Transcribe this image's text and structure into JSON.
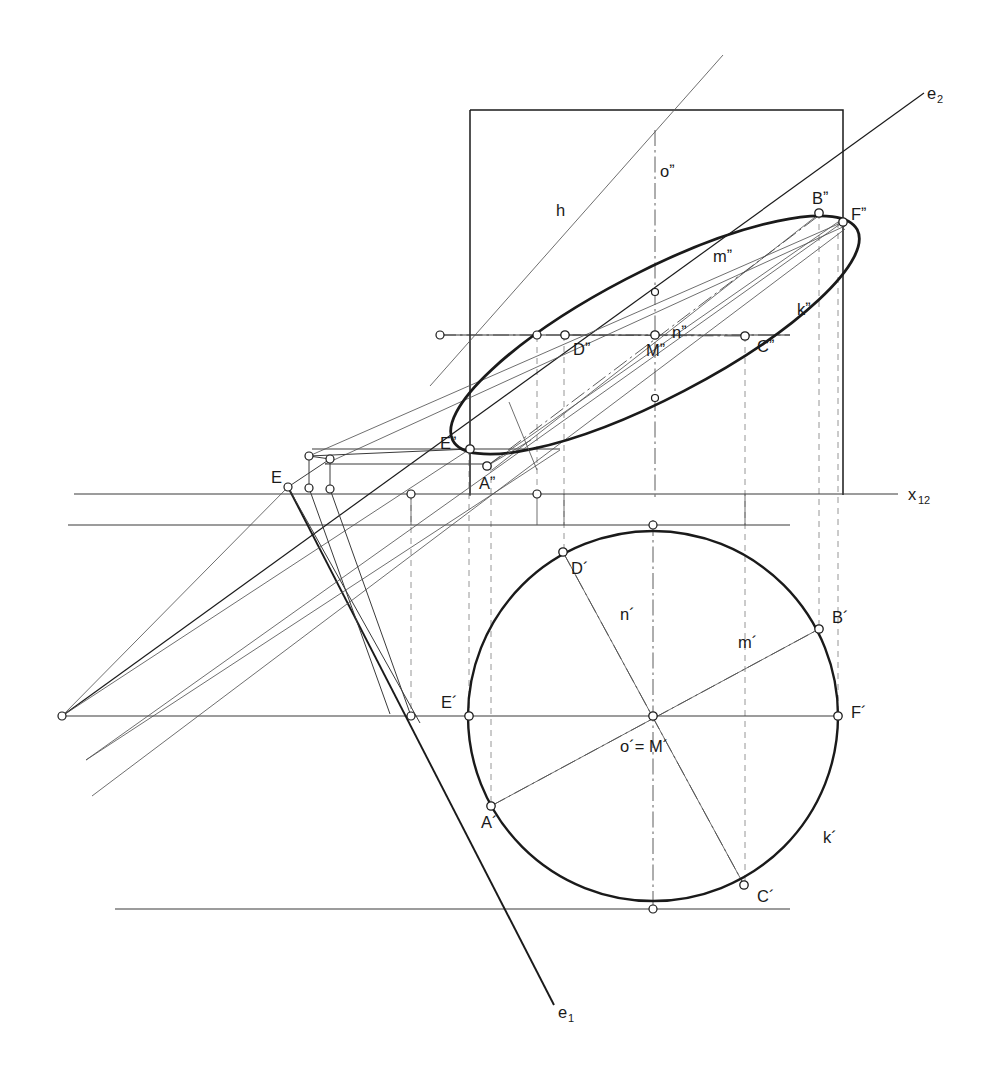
{
  "figure": {
    "kind": "descriptive-geometry-construction",
    "background_color": "#ffffff",
    "ink_color": "#1a1a1a",
    "thin_color": "#555555",
    "ground_line_label": "x_12"
  },
  "labels": {
    "axis_x12": {
      "text": "x",
      "sub": "12",
      "x": 912,
      "y": 497
    },
    "axis_e2": {
      "text": "e",
      "sub": "2",
      "x": 929,
      "y": 98
    },
    "axis_e1": {
      "text": "e",
      "sub": "1",
      "x": 561,
      "y": 1017
    },
    "h_line": {
      "text": "h",
      "x": 556,
      "y": 216
    },
    "o_front": {
      "text": "oˮ",
      "x": 660,
      "y": 177
    },
    "m_front": {
      "text": "mˮ",
      "x": 718,
      "y": 262
    },
    "n_front": {
      "text": "nˮ",
      "x": 672,
      "y": 338
    },
    "k_front": {
      "text": "kˮ",
      "x": 797,
      "y": 315
    },
    "n_top": {
      "text": "n´",
      "x": 622,
      "y": 620
    },
    "m_top": {
      "text": "m´",
      "x": 742,
      "y": 648
    },
    "k_top": {
      "text": "k´",
      "x": 823,
      "y": 843
    },
    "center_top": {
      "text": "o´= M´",
      "x": 622,
      "y": 752
    },
    "E_true": {
      "text": "E",
      "x": 271,
      "y": 483
    }
  },
  "points_front": [
    {
      "id": "A2",
      "label": "Aˮ",
      "x": 487,
      "y": 466,
      "label_dx": -8,
      "label_dy": 23,
      "marker": true
    },
    {
      "id": "B2",
      "label": "Bˮ",
      "x": 819,
      "y": 213,
      "label_dx": -7,
      "label_dy": -9,
      "marker": true
    },
    {
      "id": "C2",
      "label": "Cˮ",
      "x": 745,
      "y": 336,
      "label_dx": 12,
      "label_dy": 16,
      "marker": true
    },
    {
      "id": "D2",
      "label": "Dˮ",
      "x": 565,
      "y": 335,
      "label_dx": 8,
      "label_dy": 20,
      "marker": true
    },
    {
      "id": "E2p",
      "label": "Eˮ",
      "x": 470,
      "y": 449,
      "label_dx": -30,
      "label_dy": 0,
      "marker": true
    },
    {
      "id": "F2",
      "label": "Fˮ",
      "x": 843,
      "y": 222,
      "label_dx": 8,
      "label_dy": -2,
      "marker": true
    },
    {
      "id": "M2",
      "label": "Mˮ",
      "x": 655,
      "y": 335,
      "label_dx": -9,
      "label_dy": 21,
      "marker": true
    }
  ],
  "points_top": [
    {
      "id": "A1",
      "label": "A´",
      "x": 491,
      "y": 806,
      "label_dx": -10,
      "label_dy": 22,
      "marker": true
    },
    {
      "id": "B1",
      "label": "B´",
      "x": 819,
      "y": 629,
      "label_dx": 13,
      "label_dy": -6,
      "marker": true
    },
    {
      "id": "C1",
      "label": "C´",
      "x": 744,
      "y": 885,
      "label_dx": 13,
      "label_dy": 17,
      "marker": true
    },
    {
      "id": "D1",
      "label": "D´",
      "x": 563,
      "y": 552,
      "label_dx": 8,
      "label_dy": 22,
      "marker": true
    },
    {
      "id": "E1p",
      "label": "E´",
      "x": 469,
      "y": 716,
      "label_dx": -28,
      "label_dy": -8,
      "marker": true
    },
    {
      "id": "F1",
      "label": "F´",
      "x": 838,
      "y": 716,
      "label_dx": 13,
      "label_dy": 2,
      "marker": true
    },
    {
      "id": "M1",
      "label": "",
      "x": 653,
      "y": 716,
      "label_dx": 0,
      "label_dy": 0,
      "marker": true
    }
  ],
  "geometry": {
    "ground_line_y": 494,
    "ground_line_x_start": 74,
    "ground_line_x_end": 898,
    "second_horizontal_y": 525,
    "second_horizontal_x_start": 68,
    "second_horizontal_x_end": 790,
    "third_horizontal_y": 716,
    "third_horizontal_x_start": 62,
    "third_horizontal_x_end": 838,
    "bottom_horizontal_y": 909,
    "bottom_horizontal_x_start": 115,
    "bottom_horizontal_x_end": 790,
    "n_front_line_y": 335,
    "n_front_line_x_start": 440,
    "n_front_line_x_end": 790,
    "a_front_line_y": 449,
    "a_front_line_x_start": 312,
    "a_front_line_x_end": 560,
    "rect": {
      "x": 470,
      "y": 110,
      "w": 373,
      "h": 385
    },
    "circle_top": {
      "cx": 653,
      "cy": 716,
      "r": 185
    },
    "ellipse_front": {
      "cx": 655,
      "cy": 335,
      "rx": 228,
      "ry": 63,
      "rotation": -27.5
    },
    "vanishing_point": {
      "x": 62,
      "y": 716
    },
    "e2_line": {
      "x1": 62,
      "y1": 716,
      "x2": 924,
      "y2": 93
    },
    "e1_line": {
      "x1": 288,
      "y1": 487,
      "x2": 556,
      "y2": 1008
    },
    "h_line": {
      "x1": 430,
      "y1": 386,
      "x2": 723,
      "y2": 55
    }
  },
  "line_styles": {
    "heavy_curve": {
      "width": 2.6,
      "color": "#1a1a1a"
    },
    "medium": {
      "width": 1.5,
      "color": "#1a1a1a"
    },
    "thin": {
      "width": 0.9,
      "color": "#4a4a4a"
    },
    "dashed": {
      "width": 0.9,
      "color": "#7a7a7a",
      "dash": "6 5"
    },
    "dashdot": {
      "width": 0.9,
      "color": "#4a4a4a",
      "dash": "14 4 2 4"
    }
  }
}
